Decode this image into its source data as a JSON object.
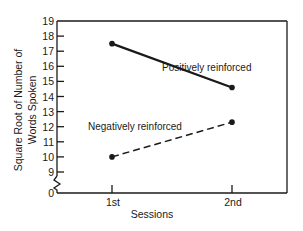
{
  "chart_data": {
    "type": "line",
    "title": "",
    "xlabel": "Sessions",
    "ylabel": "Square Root of Number of Words Spoken",
    "ylabel_lines": [
      "Square Root of Number of",
      "Words Spoken"
    ],
    "categories": [
      "1st",
      "2nd"
    ],
    "y_ticks": [
      0,
      9,
      10,
      11,
      12,
      13,
      14,
      15,
      16,
      17,
      18,
      19
    ],
    "ylim": [
      0,
      19
    ],
    "axis_break": "between 0 and 9",
    "grid": false,
    "legend": "inline labels",
    "series": [
      {
        "name": "Positively reinforced",
        "values": [
          17.5,
          14.6
        ],
        "style": "solid"
      },
      {
        "name": "Negatively reinforced",
        "values": [
          10.0,
          12.3
        ],
        "style": "dashed"
      }
    ]
  },
  "colors": {
    "ink": "#1a1a1a",
    "background": "#ffffff"
  }
}
